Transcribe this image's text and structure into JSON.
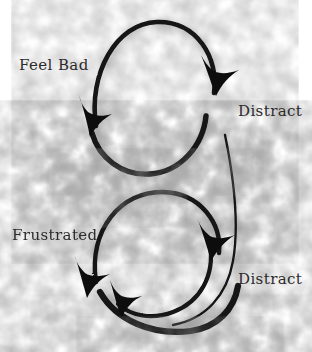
{
  "diagram": {
    "background_color": "#ffffff",
    "ink_color": "#111111",
    "smudge_color": "#9a9a9a",
    "text_color": "#2b2b2b",
    "style": "hand-drawn charcoal sketch",
    "labels": [
      {
        "id": "feel-bad",
        "text": "Feel Bad"
      },
      {
        "id": "distract-1",
        "text": "Distract"
      },
      {
        "id": "frustrated",
        "text": "Frustrated"
      },
      {
        "id": "distract-2",
        "text": "Distract"
      }
    ],
    "loops": [
      {
        "id": "upper-loop",
        "from": "Feel Bad",
        "to": "Distract",
        "arrow_count": 2,
        "direction": "clockwise"
      },
      {
        "id": "lower-loop",
        "from": "Frustrated",
        "to": "Distract",
        "arrow_count": 3,
        "direction": "clockwise"
      }
    ]
  }
}
